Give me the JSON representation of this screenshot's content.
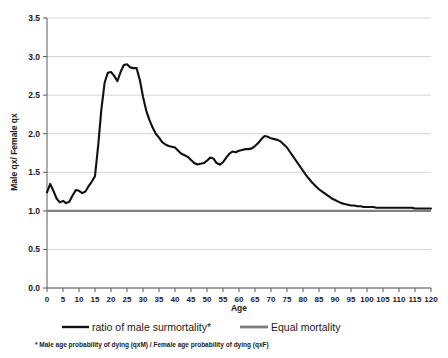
{
  "chart_data": {
    "type": "line",
    "title": "",
    "xlabel": "Age",
    "ylabel": "Male qx/ Female qx",
    "xlim": [
      0,
      120
    ],
    "ylim": [
      0.0,
      3.5
    ],
    "grid": true,
    "legend_position": "bottom",
    "xticks": [
      0,
      5,
      10,
      15,
      20,
      25,
      30,
      35,
      40,
      45,
      50,
      55,
      60,
      65,
      70,
      75,
      80,
      85,
      90,
      95,
      100,
      105,
      110,
      115,
      120
    ],
    "yticks": [
      "0.0",
      "0.5",
      "1.0",
      "1.5",
      "2.0",
      "2.5",
      "3.0",
      "3.5"
    ],
    "footnote": "* Male age probability of dying (qxM) / Female age probability of dying (qxF)",
    "colors": {
      "ratio_line": "#101010",
      "equal_line": "#808080",
      "gridline": "#c9c9c9",
      "axis": "#5a5a5a"
    },
    "series": [
      {
        "name": "ratio of male surmortality*",
        "color": "#101010",
        "x": [
          0,
          1,
          2,
          3,
          4,
          5,
          6,
          7,
          8,
          9,
          10,
          11,
          12,
          13,
          14,
          15,
          16,
          17,
          18,
          19,
          20,
          21,
          22,
          23,
          24,
          25,
          26,
          27,
          28,
          29,
          30,
          31,
          32,
          33,
          34,
          35,
          36,
          37,
          38,
          39,
          40,
          41,
          42,
          43,
          44,
          45,
          46,
          47,
          48,
          49,
          50,
          51,
          52,
          53,
          54,
          55,
          56,
          57,
          58,
          59,
          60,
          61,
          62,
          63,
          64,
          65,
          66,
          67,
          68,
          69,
          70,
          71,
          72,
          73,
          74,
          75,
          76,
          77,
          78,
          79,
          80,
          81,
          82,
          83,
          84,
          85,
          86,
          87,
          88,
          89,
          90,
          91,
          92,
          93,
          94,
          95,
          96,
          97,
          98,
          99,
          100,
          101,
          102,
          103,
          104,
          105,
          106,
          107,
          108,
          109,
          110,
          111,
          112,
          113,
          114,
          115,
          116,
          117,
          118,
          119,
          120
        ],
        "values": [
          1.24,
          1.35,
          1.26,
          1.16,
          1.11,
          1.13,
          1.1,
          1.12,
          1.2,
          1.27,
          1.26,
          1.23,
          1.25,
          1.32,
          1.38,
          1.45,
          1.85,
          2.32,
          2.66,
          2.79,
          2.8,
          2.75,
          2.68,
          2.8,
          2.89,
          2.9,
          2.86,
          2.85,
          2.85,
          2.7,
          2.48,
          2.3,
          2.18,
          2.08,
          2.0,
          1.95,
          1.89,
          1.86,
          1.84,
          1.83,
          1.82,
          1.78,
          1.74,
          1.72,
          1.7,
          1.66,
          1.62,
          1.6,
          1.61,
          1.62,
          1.65,
          1.69,
          1.68,
          1.62,
          1.6,
          1.63,
          1.69,
          1.74,
          1.77,
          1.76,
          1.78,
          1.79,
          1.8,
          1.8,
          1.81,
          1.84,
          1.88,
          1.93,
          1.97,
          1.96,
          1.94,
          1.93,
          1.92,
          1.9,
          1.86,
          1.82,
          1.76,
          1.7,
          1.64,
          1.58,
          1.52,
          1.46,
          1.41,
          1.36,
          1.32,
          1.28,
          1.25,
          1.22,
          1.19,
          1.16,
          1.14,
          1.12,
          1.1,
          1.09,
          1.08,
          1.07,
          1.07,
          1.06,
          1.06,
          1.05,
          1.05,
          1.05,
          1.05,
          1.04,
          1.04,
          1.04,
          1.04,
          1.04,
          1.04,
          1.04,
          1.04,
          1.04,
          1.04,
          1.04,
          1.04,
          1.03,
          1.03,
          1.03,
          1.03,
          1.03,
          1.03
        ]
      },
      {
        "name": "Equal mortality",
        "color": "#808080",
        "x": [
          0,
          120
        ],
        "values": [
          1.0,
          1.0
        ]
      }
    ]
  },
  "legend": {
    "items": [
      {
        "label": "ratio of male surmortality*",
        "swatch": "black-line"
      },
      {
        "label": "Equal mortality",
        "swatch": "gray-line"
      }
    ]
  },
  "axes": {
    "y_title": "Male qx/ Female qx",
    "x_title": "Age"
  },
  "footnote": {
    "text": "* Male age probability of dying (qxM) / Female age probability of dying (qxF)"
  }
}
